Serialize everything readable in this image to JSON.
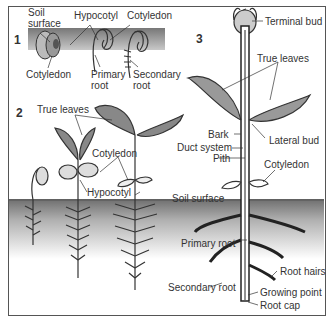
{
  "panels": {
    "p1": {
      "number": "1",
      "labels": {
        "soil_surface_1": "Soil",
        "soil_surface_2": "surface",
        "hypocotyl": "Hypocotyl",
        "cotyledon_top": "Cotyledon",
        "cotyledon_bottom": "Cotyledon",
        "primary_root_1": "Primary",
        "primary_root_2": "root",
        "secondary_root_1": "Secondary",
        "secondary_root_2": "root"
      }
    },
    "p2": {
      "number": "2",
      "labels": {
        "true_leaves": "True leaves",
        "cotyledon": "Cotyledon",
        "hypocotyl": "Hypocotyl"
      }
    },
    "p3": {
      "number": "3",
      "labels": {
        "terminal_bud": "Terminal bud",
        "true_leaves": "True leaves",
        "bark": "Bark",
        "lateral_bud": "Lateral bud",
        "duct_system": "Duct system",
        "pith": "Pith",
        "cotyledon": "Cotyledon",
        "soil_surface": "Soil surface",
        "primary_root": "Primary root",
        "root_hairs": "Root hairs",
        "secondary_root": "Secondary root",
        "growing_point": "Growing point",
        "root_cap": "Root cap"
      }
    }
  },
  "colors": {
    "soil": "#8a8a8a",
    "leaf": "#9a9a9a",
    "stem": "#444444",
    "line": "#333333"
  }
}
